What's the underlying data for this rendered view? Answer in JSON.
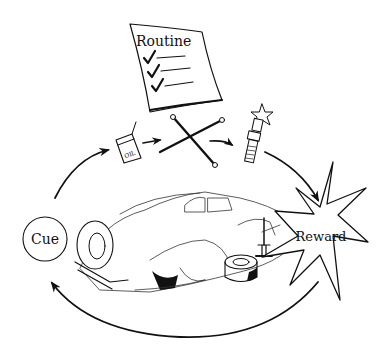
{
  "diagram": {
    "nodes": {
      "routine": {
        "label": "Routine",
        "checklist_items": 3
      },
      "cue": {
        "label": "Cue"
      },
      "reward": {
        "label": "Reward"
      }
    },
    "routine_steps": [
      {
        "name": "oil-can",
        "label": "OIL"
      },
      {
        "name": "lug-wrench",
        "label": ""
      },
      {
        "name": "spark-plug",
        "label": ""
      }
    ],
    "center_image": "vintage car on jack with removed tire",
    "colors": {
      "ink": "#111111",
      "background": "#ffffff"
    }
  }
}
